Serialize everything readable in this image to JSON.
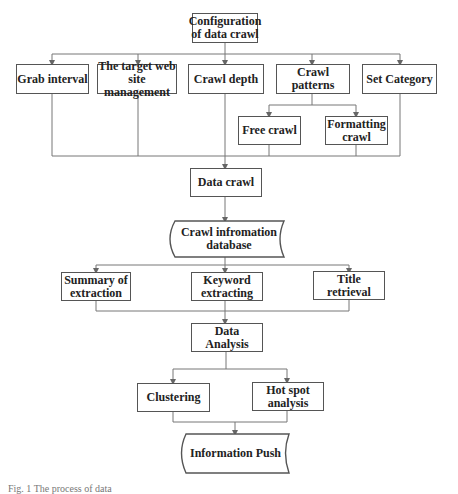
{
  "nodes": {
    "config": "Configuration of data crawl",
    "grab_interval": "Grab interval",
    "target_site": "The target web site management",
    "crawl_depth": "Crawl depth",
    "crawl_patterns": "Crawl patterns",
    "set_category": "Set Category",
    "free_crawl": "Free crawl",
    "formatting_crawl": "Formatting crawl",
    "data_crawl": "Data crawl",
    "crawl_db": "Crawl infromation database",
    "summary": "Summary of extraction",
    "keyword": "Keyword extracting",
    "title_retrieval": "Title retrieval",
    "data_analysis": "Data Analysis",
    "clustering": "Clustering",
    "hot_spot": "Hot spot analysis",
    "info_push": "Information Push"
  },
  "caption": "Fig. 1 The process of data"
}
